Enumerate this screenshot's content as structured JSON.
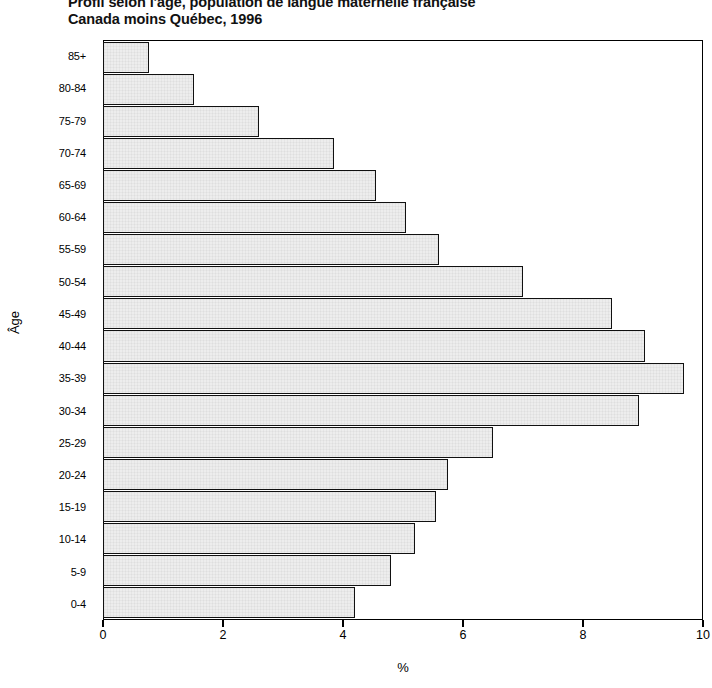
{
  "title": {
    "line1": "Profil selon l'âge, population de langue maternelle française",
    "line2": "Canada moins Québec, 1996"
  },
  "axes": {
    "y_title": "Âge",
    "x_title": "%",
    "x_ticks": [
      "0",
      "2",
      "4",
      "6",
      "8",
      "10"
    ]
  },
  "chart_data": {
    "type": "bar",
    "orientation": "horizontal",
    "title": "Profil selon l'âge, population de langue maternelle française Canada moins Québec, 1996",
    "xlabel": "%",
    "ylabel": "Âge",
    "xlim": [
      0,
      10
    ],
    "xticks": [
      0,
      2,
      4,
      6,
      8,
      10
    ],
    "grid": false,
    "legend": null,
    "categories": [
      "85+",
      "80-84",
      "75-79",
      "70-74",
      "65-69",
      "60-64",
      "55-59",
      "50-54",
      "45-49",
      "40-44",
      "35-39",
      "30-34",
      "25-29",
      "20-24",
      "15-19",
      "10-14",
      "5-9",
      "0-4"
    ],
    "values": [
      0.75,
      1.5,
      2.6,
      3.85,
      4.55,
      5.05,
      5.6,
      7.0,
      8.5,
      9.05,
      9.7,
      8.95,
      6.5,
      5.75,
      5.55,
      5.2,
      4.8,
      4.2
    ],
    "bar_fill": "#ededed",
    "bar_edge": "#111111"
  }
}
